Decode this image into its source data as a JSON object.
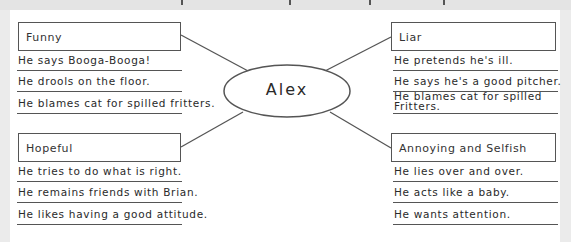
{
  "diagram": {
    "center": {
      "label": "Alex"
    },
    "branches": [
      {
        "id": "funny",
        "title": "Funny",
        "details": [
          "He says Booga-Booga!",
          "He drools on the floor.",
          "He blames cat for spilled fritters."
        ]
      },
      {
        "id": "liar",
        "title": "Liar",
        "details": [
          "He pretends he's ill.",
          "He says he's a good pitcher.",
          "He blames cat for spilled Fritters."
        ]
      },
      {
        "id": "hopeful",
        "title": "Hopeful",
        "details": [
          "He tries to do what is right.",
          "He remains friends with Brian.",
          "He likes having a good attitude."
        ]
      },
      {
        "id": "annoying",
        "title": "Annoying and Selfish",
        "details": [
          "He lies over and over.",
          "He acts like a baby.",
          "He wants attention."
        ]
      }
    ]
  },
  "colors": {
    "stroke": "#555555",
    "background": "#ebebeb",
    "panel": "#ffffff"
  }
}
